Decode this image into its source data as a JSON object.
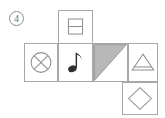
{
  "option": {
    "label": "4",
    "marker_style": "circled-numeral"
  },
  "figure": {
    "type": "cube-net-puzzle",
    "stroke_color": "#a8a8a8",
    "fill_color": "#b8b8b8",
    "background_color": "#ffffff",
    "faces": [
      {
        "id": "top",
        "position": "row1-col2",
        "symbol_name": "divided-rectangle",
        "symbol_label": "rectangle split by horizontal line",
        "x": 58,
        "y": 10,
        "w": 35,
        "h": 34
      },
      {
        "id": "left",
        "position": "row2-col1",
        "symbol_name": "circled-cross",
        "symbol_label": "circle with diagonal cross",
        "x": 24,
        "y": 43,
        "w": 34,
        "h": 39
      },
      {
        "id": "note",
        "position": "row2-col2",
        "symbol_name": "eighth-note",
        "symbol_label": "musical eighth note",
        "x": 58,
        "y": 43,
        "w": 35,
        "h": 39
      },
      {
        "id": "shaded-triangle",
        "position": "row2-col3",
        "symbol_name": "filled-triangle",
        "symbol_label": "shaded right triangle, upper-left half",
        "x": 93,
        "y": 43,
        "w": 35,
        "h": 39
      },
      {
        "id": "arch",
        "position": "row2-col4",
        "symbol_name": "triangle-with-bar",
        "symbol_label": "triangle with horizontal base bar",
        "x": 128,
        "y": 43,
        "w": 30,
        "h": 39
      },
      {
        "id": "diamond",
        "position": "row3-col4",
        "symbol_name": "diamond-outline",
        "symbol_label": "diamond (rotated square) outline",
        "x": 122,
        "y": 82,
        "w": 36,
        "h": 33
      }
    ]
  }
}
